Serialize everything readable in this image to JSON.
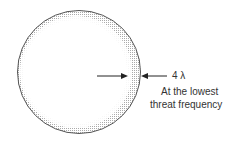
{
  "diagram": {
    "thickness_label": "4 λ",
    "note_line1": "At the lowest",
    "note_line2": "threat frequency",
    "colors": {
      "outline": "#555555",
      "shading": "#c8c8c8",
      "arrow": "#222222"
    }
  }
}
